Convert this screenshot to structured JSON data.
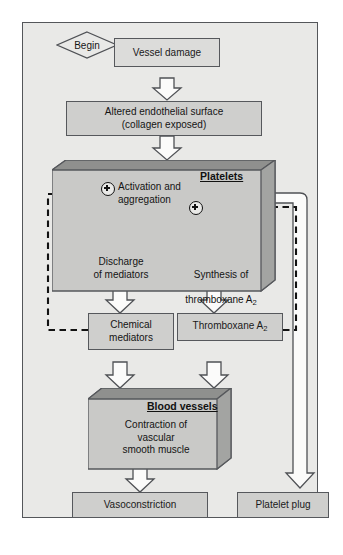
{
  "diagram": {
    "colors": {
      "page_background": "#e9e9e7",
      "box_fill": "#cfcfcd",
      "box_light_fill": "#dcdcda",
      "box_border": "#56585c",
      "arrow_fill": "#fbfbfa",
      "arrow_stroke": "#4f5155",
      "dashed_line": "#121212",
      "box3d_top": "#8f908e",
      "box3d_side": "#a3a4a2"
    },
    "start": {
      "label": "Begin"
    },
    "nodes": {
      "vessel_damage": {
        "label": "Vessel damage"
      },
      "altered_endothelial": {
        "label": "Altered endothelial surface\n(collagen exposed)"
      },
      "platelets_header": {
        "label": "Platelets"
      },
      "activation": {
        "label": "Activation and\naggregation"
      },
      "discharge": {
        "label": "Discharge\nof mediators"
      },
      "synthesis": {
        "label": "Synthesis of",
        "label2": "thromboxane A",
        "sub": "2"
      },
      "chemical_mediators": {
        "label": "Chemical\nmediators"
      },
      "thromboxane": {
        "label": "Thromboxane A",
        "sub": "2"
      },
      "blood_vessels_header": {
        "label": "Blood vessels"
      },
      "contraction": {
        "label": "Contraction of\nvascular\nsmooth muscle"
      },
      "vasoconstriction": {
        "label": "Vasoconstriction"
      },
      "platelet_plug": {
        "label": "Platelet plug"
      }
    },
    "symbols": {
      "plus_left": "+",
      "plus_right": "+"
    }
  }
}
